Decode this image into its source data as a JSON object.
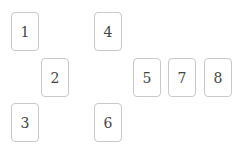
{
  "cards": [
    {
      "label": "1"
    },
    {
      "label": "4"
    },
    {
      "label": "2"
    },
    {
      "label": "5"
    },
    {
      "label": "7"
    },
    {
      "label": "8"
    },
    {
      "label": "3"
    },
    {
      "label": "6"
    }
  ]
}
